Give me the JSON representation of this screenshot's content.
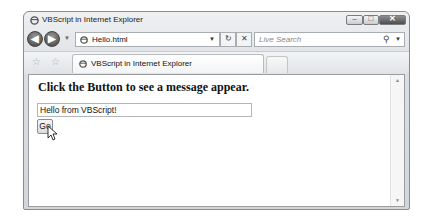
{
  "window": {
    "title": "VBScript in Internet Explorer",
    "controls": {
      "minimize": "–",
      "maximize": "□",
      "close": "✕"
    }
  },
  "navbar": {
    "back_icon": "◀",
    "forward_icon": "▶",
    "history_dropdown": "▼",
    "address": "Hello.html",
    "address_dropdown": "▼",
    "refresh_icon": "↻",
    "stop_icon": "✕",
    "search_placeholder": "Live Search",
    "search_icon": "⚲",
    "search_dropdown": "▼"
  },
  "tabbar": {
    "favorites_icon": "☆",
    "add_favorites_icon": "☆",
    "active_tab": "VBScript in Internet Explorer"
  },
  "page": {
    "heading": "Click the Button to see a message appear.",
    "textbox_value": "Hello from VBScript!",
    "button_label": "Go"
  },
  "scrollbar": {
    "up": "▲",
    "down": "▼"
  }
}
